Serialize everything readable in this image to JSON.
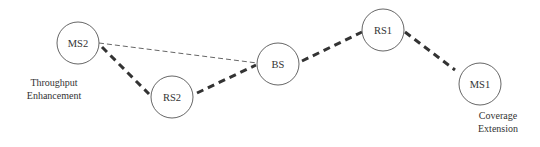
{
  "diagram": {
    "type": "relay-network",
    "nodes": [
      {
        "id": "MS2",
        "label": "MS2",
        "cx": 78,
        "cy": 43,
        "r": 21
      },
      {
        "id": "RS2",
        "label": "RS2",
        "cx": 172,
        "cy": 97,
        "r": 21
      },
      {
        "id": "BS",
        "label": "BS",
        "cx": 278,
        "cy": 64,
        "r": 21
      },
      {
        "id": "RS1",
        "label": "RS1",
        "cx": 383,
        "cy": 30,
        "r": 21
      },
      {
        "id": "MS1",
        "label": "MS1",
        "cx": 480,
        "cy": 84,
        "r": 21
      }
    ],
    "links": [
      {
        "from": "MS2",
        "to": "RS2",
        "style": "thick-dashed"
      },
      {
        "from": "RS2",
        "to": "BS",
        "style": "thick-dashed"
      },
      {
        "from": "BS",
        "to": "RS1",
        "style": "thick-dashed"
      },
      {
        "from": "RS1",
        "to": "MS1",
        "style": "thick-dashed"
      },
      {
        "from": "MS2",
        "to": "BS",
        "style": "thin-dashed"
      }
    ],
    "captions": {
      "throughput": {
        "line1": "Throughput",
        "line2": "Enhancement"
      },
      "coverage": {
        "line1": "Coverage",
        "line2": "Extension"
      }
    },
    "colors": {
      "stroke": "#333333",
      "circle": "#555555",
      "text": "#333333",
      "background": "#ffffff"
    }
  }
}
